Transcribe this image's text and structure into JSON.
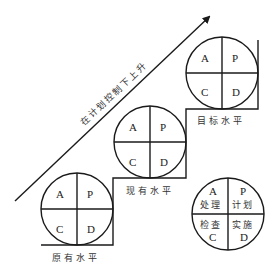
{
  "diagram": {
    "arrow_label": "在计划控制下上升",
    "colors": {
      "line": "#1a1a1a",
      "text": "#333333",
      "background": "#ffffff"
    },
    "levels": [
      {
        "name": "原有水平",
        "quadrants": {
          "top_left": "A",
          "top_right": "P",
          "bottom_left": "C",
          "bottom_right": "D"
        }
      },
      {
        "name": "现有水平",
        "quadrants": {
          "top_left": "A",
          "top_right": "P",
          "bottom_left": "C",
          "bottom_right": "D"
        }
      },
      {
        "name": "目标水平",
        "quadrants": {
          "top_left": "A",
          "top_right": "P",
          "bottom_left": "C",
          "bottom_right": "D"
        }
      }
    ],
    "legend": {
      "top_left": {
        "letter": "A",
        "text": "处理"
      },
      "top_right": {
        "letter": "P",
        "text": "计划"
      },
      "bottom_left": {
        "letter": "C",
        "text": "检查"
      },
      "bottom_right": {
        "letter": "D",
        "text": "实施"
      }
    }
  }
}
